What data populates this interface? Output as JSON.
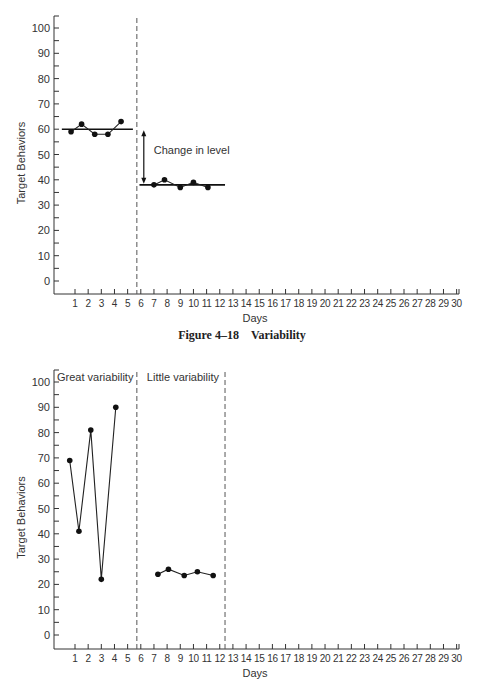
{
  "caption": {
    "figure_number": "Figure 4–18",
    "figure_title": "Variability"
  },
  "chart_data": [
    {
      "type": "line",
      "title": "",
      "xlabel": "Days",
      "ylabel": "Target Behaviors",
      "xlim": [
        0,
        30
      ],
      "ylim": [
        -5,
        105
      ],
      "yticks": [
        0,
        10,
        20,
        30,
        40,
        50,
        60,
        70,
        80,
        90,
        100
      ],
      "xticks": [
        1,
        2,
        3,
        4,
        5,
        6,
        7,
        8,
        9,
        10,
        11,
        12,
        13,
        14,
        15,
        16,
        17,
        18,
        19,
        20,
        21,
        22,
        23,
        24,
        25,
        26,
        27,
        28,
        29,
        30
      ],
      "grid": false,
      "phase_lines": [
        5.7
      ],
      "series": [
        {
          "name": "Phase 1",
          "x": [
            0.7,
            1.5,
            2.5,
            3.5,
            4.5
          ],
          "values": [
            59,
            62,
            58,
            58,
            63
          ]
        },
        {
          "name": "Phase 2",
          "x": [
            7.0,
            7.8,
            9.0,
            10.0,
            11.1
          ],
          "values": [
            38,
            40,
            37,
            39,
            37
          ]
        }
      ],
      "level_lines": [
        {
          "from": 0.0,
          "to": 5.4,
          "value": 60
        },
        {
          "from": 5.9,
          "to": 12.4,
          "value": 38
        }
      ],
      "annotations": [
        {
          "text": "Change in level",
          "type": "double-arrow",
          "x": 6.0,
          "from": 60,
          "to": 38
        }
      ]
    },
    {
      "type": "line",
      "title": "",
      "xlabel": "Days",
      "ylabel": "Target Behaviors",
      "xlim": [
        0,
        30
      ],
      "ylim": [
        -5,
        105
      ],
      "yticks": [
        0,
        10,
        20,
        30,
        40,
        50,
        60,
        70,
        80,
        90,
        100
      ],
      "xticks": [
        1,
        2,
        3,
        4,
        5,
        6,
        7,
        8,
        9,
        10,
        11,
        12,
        13,
        14,
        15,
        16,
        17,
        18,
        19,
        20,
        21,
        22,
        23,
        24,
        25,
        26,
        27,
        28,
        29,
        30
      ],
      "grid": false,
      "phase_lines": [
        5.7,
        12.4
      ],
      "phase_labels": [
        "Great variability",
        "Little variability"
      ],
      "series": [
        {
          "name": "Great variability",
          "x": [
            0.6,
            1.3,
            2.2,
            3.0,
            4.1
          ],
          "values": [
            69,
            41,
            81,
            22,
            90
          ]
        },
        {
          "name": "Little variability",
          "x": [
            7.3,
            8.1,
            9.3,
            10.3,
            11.5
          ],
          "values": [
            24,
            26,
            23.5,
            25,
            23.5
          ]
        }
      ]
    }
  ]
}
